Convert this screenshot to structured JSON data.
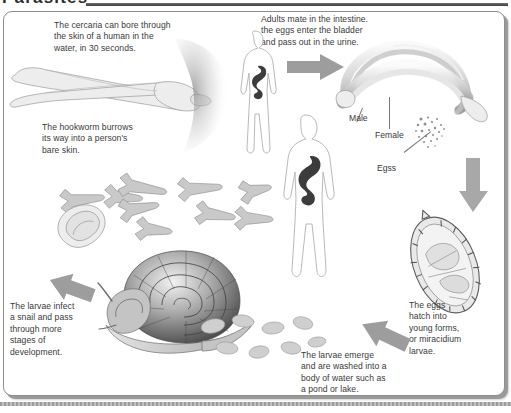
{
  "header": {
    "title": "Parasites",
    "rule": "horizontal-rule"
  },
  "diagram": {
    "captions": {
      "cercaria": "The cercaria can bore through\nthe skin of a human in the\nwater, in 30 seconds.",
      "hookworm": "The hookworm burrows\nits way into a person's\nbare skin.",
      "adults_mate": "Adults mate in the intestine.\nthe eggs enter the bladder\nand pass out in the urine.",
      "eggs_hatch": "The eggs\nhatch into\nyoung forms,\nor miracidium\nlarvae.",
      "larvae_emerge": "The larvae emerge\nand are washed into a\nbody of water such as\na pond or lake.",
      "larvae_infect_snail": "The larvae infect\na snail and pass\nthrough more\nstages of\ndevelopment."
    },
    "labels": {
      "male": "Male",
      "female": "Female",
      "eggs": "Egss"
    },
    "figures": {
      "cercaria": "cercaria-larva",
      "human_male": "human-figure-male",
      "human_female": "human-figure-female",
      "adult_worms": "adult-schistosome-pair",
      "egg_capsule": "parasite-egg",
      "snail": "snail",
      "larvae_swarm": "larvae-cluster"
    },
    "arrows": {
      "to_human": "arrow-right",
      "to_eggs": "arrow-down",
      "to_water": "arrow-down-left",
      "to_snail": "arrow-up-left"
    },
    "colors": {
      "arrow": "#9c9c9c",
      "text": "#3a3a3a",
      "frame": "#8d8d8d",
      "gut": "#3c3c3c"
    }
  }
}
